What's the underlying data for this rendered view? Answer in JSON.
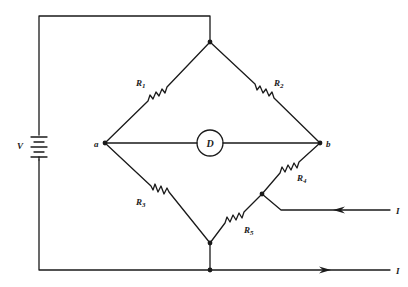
{
  "diagram": {
    "type": "bridge-circuit",
    "source": {
      "label": "V"
    },
    "nodes": [
      {
        "id": "a",
        "label": "a"
      },
      {
        "id": "b",
        "label": "b"
      }
    ],
    "detector": {
      "label": "D"
    },
    "resistors": [
      {
        "id": "R1",
        "letter": "R",
        "sub": "1"
      },
      {
        "id": "R2",
        "letter": "R",
        "sub": "2"
      },
      {
        "id": "R3",
        "letter": "R",
        "sub": "3"
      },
      {
        "id": "R4",
        "letter": "R",
        "sub": "4"
      },
      {
        "id": "R5",
        "letter": "R",
        "sub": "5"
      }
    ],
    "currents": [
      {
        "id": "in",
        "label": "I",
        "direction": "in"
      },
      {
        "id": "out",
        "label": "I",
        "direction": "out"
      }
    ],
    "colors": {
      "ink": "#1a1a1a",
      "background": "#ffffff"
    }
  }
}
